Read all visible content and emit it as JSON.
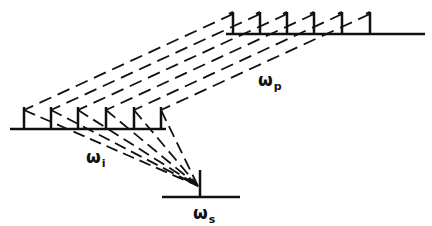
{
  "diagram": {
    "type": "frequency-comb-mapping",
    "labels": {
      "pump": {
        "symbol": "ω",
        "subscript": "p"
      },
      "idler": {
        "symbol": "ω",
        "subscript": "i"
      },
      "signal": {
        "symbol": "ω",
        "subscript": "s"
      }
    },
    "combs": {
      "pump": {
        "tooth_count": 6
      },
      "idler": {
        "tooth_count": 6
      },
      "signal": {
        "tooth_count": 1
      }
    },
    "colors": {
      "ink": "#111111",
      "background": "#ffffff"
    }
  }
}
